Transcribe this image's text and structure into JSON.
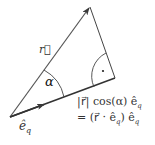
{
  "diagram": {
    "type": "vector-projection",
    "labels": {
      "r_vector": "r⃗",
      "unit_vector": "ê",
      "unit_vector_sub": "q",
      "angle": "α",
      "projection_line1": "|r⃗| cos(α) ê",
      "projection_line1_sub": "q",
      "projection_line2": "= (r⃗ · ê",
      "projection_line2_sub": "q",
      "projection_line2_tail": ") ê",
      "projection_line2_sub2": "q"
    },
    "colors": {
      "stroke": "#3a3a3a",
      "text": "#333333",
      "background": "#ffffff"
    }
  }
}
